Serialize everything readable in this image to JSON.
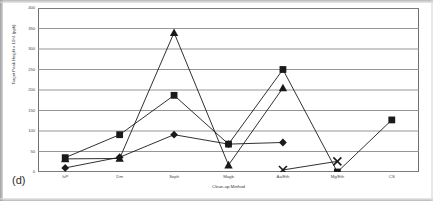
{
  "figure": {
    "panel_label": "(d)"
  },
  "chart_data": {
    "type": "line",
    "title": "",
    "xlabel": "Clean-up Method",
    "ylabel": "Target Peak Height x 10^4 (ppb)",
    "categories": [
      "IvP",
      "Dm",
      "Seph",
      "Magb",
      "Aa/Eth",
      "Mg/Eth",
      "CS"
    ],
    "ylim": [
      0,
      400
    ],
    "ytick_step": 50,
    "yticks": [
      0,
      50,
      100,
      150,
      200,
      250,
      300,
      350,
      400
    ],
    "ytick_labels": [
      "0",
      "50",
      "100",
      "150",
      "200",
      "250",
      "300",
      "350",
      "400"
    ],
    "grid": "horizontal",
    "legend": "none",
    "line_color": "#1a1a1a",
    "series": [
      {
        "name": "Series 1",
        "marker": "diamond",
        "x": [
          "IvP",
          "Dm",
          "Seph",
          "Magb",
          "Aa/Eth"
        ],
        "values": [
          10,
          36,
          91,
          68,
          72
        ]
      },
      {
        "name": "Series 2",
        "marker": "square",
        "x": [
          "IvP",
          "Dm",
          "Seph",
          "Magb",
          "Aa/Eth",
          "Mg/Eth",
          "CS"
        ],
        "values": [
          35,
          91,
          187,
          68,
          250,
          0,
          127
        ]
      },
      {
        "name": "Series 3",
        "marker": "triangle",
        "x": [
          "IvP",
          "Dm",
          "Seph",
          "Magb",
          "Aa/Eth"
        ],
        "values": [
          32,
          33,
          340,
          17,
          205
        ]
      },
      {
        "name": "Series 4",
        "marker": "cross",
        "x": [
          "Aa/Eth",
          "Mg/Eth"
        ],
        "values": [
          5,
          26
        ]
      }
    ]
  }
}
